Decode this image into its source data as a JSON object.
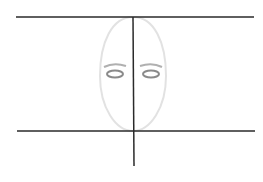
{
  "diagram": {
    "elements": [
      {
        "name": "top-guide-line",
        "kind": "line"
      },
      {
        "name": "bottom-guide-line",
        "kind": "line"
      },
      {
        "name": "vertical-center-line",
        "kind": "line"
      },
      {
        "name": "face-oval",
        "kind": "ellipse"
      },
      {
        "name": "left-eye",
        "kind": "eye"
      },
      {
        "name": "right-eye",
        "kind": "eye"
      }
    ],
    "colors": {
      "guide": "#2a2a2a",
      "oval": "#e2e2e2",
      "eye": "#8a8a8a",
      "brow": "#b0b0b0"
    }
  }
}
